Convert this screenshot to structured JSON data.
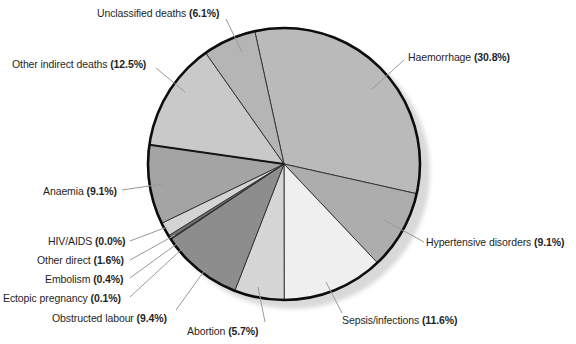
{
  "chart_data": {
    "type": "pie",
    "title": "",
    "unit": "%",
    "start_angle_deg": -12.4,
    "legend_position": "none",
    "label_style": "outside-with-leader-lines",
    "slices": [
      {
        "id": "haemorrhage",
        "label": "Haemorrhage",
        "value": 30.8,
        "pct_display": "(30.8%)",
        "color": "#bababa"
      },
      {
        "id": "hypertensive",
        "label": "Hypertensive disorders",
        "value": 9.1,
        "pct_display": "(9.1%)",
        "color": "#adadad"
      },
      {
        "id": "sepsis",
        "label": "Sepsis/infections",
        "value": 11.6,
        "pct_display": "(11.6%)",
        "color": "#efefef"
      },
      {
        "id": "abortion",
        "label": "Abortion",
        "value": 5.7,
        "pct_display": "(5.7%)",
        "color": "#d6d6d6"
      },
      {
        "id": "obstructed_labour",
        "label": "Obstructed labour",
        "value": 9.4,
        "pct_display": "(9.4%)",
        "color": "#8d8d8d"
      },
      {
        "id": "ectopic_pregnancy",
        "label": "Ectopic pregnancy",
        "value": 0.1,
        "pct_display": "(0.1%)",
        "color": "#4a4a4a"
      },
      {
        "id": "embolism",
        "label": "Embolism",
        "value": 0.4,
        "pct_display": "(0.4%)",
        "color": "#737373"
      },
      {
        "id": "other_direct",
        "label": "Other direct",
        "value": 1.6,
        "pct_display": "(1.6%)",
        "color": "#d4d4d4"
      },
      {
        "id": "hiv_aids",
        "label": "HIV/AIDS",
        "value": 0.0,
        "pct_display": "(0.0%)",
        "color": "#999999"
      },
      {
        "id": "anaemia",
        "label": "Anaemia",
        "value": 9.1,
        "pct_display": "(9.1%)",
        "color": "#a4a4a4"
      },
      {
        "id": "other_indirect",
        "label": "Other indirect deaths",
        "value": 12.5,
        "pct_display": "(12.5%)",
        "color": "#c9c9c9"
      },
      {
        "id": "unclassified",
        "label": "Unclassified deaths",
        "value": 6.1,
        "pct_display": "(6.1%)",
        "color": "#b5b5b5"
      }
    ],
    "colors": {
      "outline": "#0d0d0d",
      "slice_border": "#2e2e2e",
      "emphasized_border": "#161616",
      "shadow": "#d9d9d9",
      "leader_line": "#9a9a9a",
      "text": "#1f1f1f",
      "background": "#ffffff"
    }
  }
}
